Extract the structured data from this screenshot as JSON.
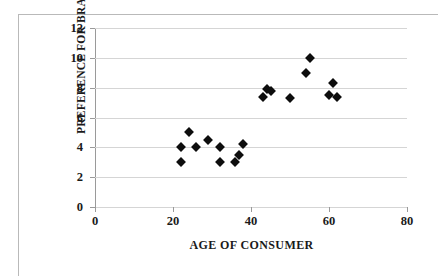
{
  "chart_data": {
    "type": "scatter",
    "title": "",
    "xlabel": "AGE OF CONSUMER",
    "ylabel": "PREFERENCE FOR BRAND A",
    "xlim": [
      0,
      80
    ],
    "ylim": [
      0,
      12
    ],
    "xticks": [
      0,
      20,
      40,
      60,
      80
    ],
    "yticks": [
      0,
      2,
      4,
      6,
      8,
      10,
      12
    ],
    "xtick_labels": [
      "0",
      "20",
      "40",
      "60",
      "80"
    ],
    "ytick_labels": [
      "0",
      "2",
      "4",
      "6",
      "8",
      "10",
      "12"
    ],
    "grid": "horizontal",
    "legend": "none",
    "marker": "filled-diamond",
    "marker_color": "#0d0d0d",
    "series": [
      {
        "name": "consumers",
        "points": [
          {
            "x": 22,
            "y": 4.0
          },
          {
            "x": 22,
            "y": 3.0
          },
          {
            "x": 24,
            "y": 5.0
          },
          {
            "x": 26,
            "y": 4.0
          },
          {
            "x": 29,
            "y": 4.5
          },
          {
            "x": 32,
            "y": 4.0
          },
          {
            "x": 32,
            "y": 3.0
          },
          {
            "x": 36,
            "y": 3.0
          },
          {
            "x": 37,
            "y": 3.5
          },
          {
            "x": 38,
            "y": 4.2
          },
          {
            "x": 43,
            "y": 7.4
          },
          {
            "x": 44,
            "y": 7.9
          },
          {
            "x": 45,
            "y": 7.8
          },
          {
            "x": 50,
            "y": 7.3
          },
          {
            "x": 54,
            "y": 9.0
          },
          {
            "x": 55,
            "y": 10.0
          },
          {
            "x": 60,
            "y": 7.5
          },
          {
            "x": 61,
            "y": 8.3
          },
          {
            "x": 62,
            "y": 7.4
          }
        ]
      }
    ]
  }
}
